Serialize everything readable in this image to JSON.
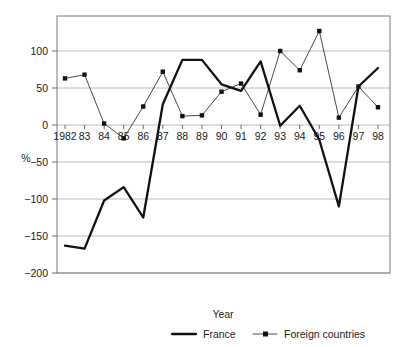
{
  "chart_data": {
    "type": "line",
    "title": "",
    "xlabel": "Year",
    "ylabel": "%",
    "xlim": [
      1982,
      1998
    ],
    "ylim": [
      -200,
      135
    ],
    "yticks": [
      100,
      50,
      0,
      -50,
      -100,
      -150,
      -200
    ],
    "ytick_labels": [
      "100",
      "50",
      "0",
      "−50",
      "−100",
      "−150",
      "−200"
    ],
    "grid": true,
    "legend_position": "bottom",
    "x": [
      1982,
      1983,
      1984,
      1985,
      1986,
      1987,
      1988,
      1989,
      1990,
      1991,
      1992,
      1993,
      1994,
      1995,
      1996,
      1997,
      1998
    ],
    "xtick_labels": [
      "1982",
      "83",
      "84",
      "85",
      "86",
      "87",
      "88",
      "89",
      "90",
      "91",
      "92",
      "93",
      "94",
      "95",
      "96",
      "97",
      "98"
    ],
    "series": [
      {
        "name": "France",
        "style": "thick-solid-line",
        "marker": "none",
        "color": "#111111",
        "values": [
          -163,
          -167,
          -102,
          -84,
          -125,
          28,
          88,
          88,
          55,
          46,
          86,
          -1,
          26,
          -20,
          -110,
          52,
          77
        ]
      },
      {
        "name": "Foreign countries",
        "style": "thin-line-with-dots",
        "marker": "dot",
        "color": "#333333",
        "values": [
          63,
          68,
          2,
          -18,
          25,
          72,
          12,
          13,
          45,
          56,
          14,
          100,
          74,
          127,
          10,
          52,
          24
        ]
      }
    ]
  },
  "axes": {
    "x_axis_title": "Year",
    "y_unit_label": "%"
  },
  "legend": {
    "items": [
      {
        "label": "France",
        "key": "france"
      },
      {
        "label": "Foreign countries",
        "key": "foreign-countries"
      }
    ]
  }
}
